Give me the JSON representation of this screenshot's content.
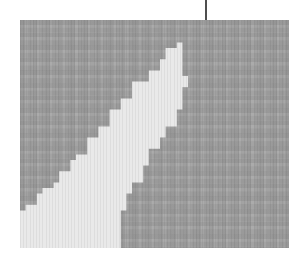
{
  "figure": {
    "kind": "grayscale-raster-map",
    "width": 299,
    "height": 262,
    "background_color": "#ffffff",
    "alt_caption": ""
  },
  "pointer": {
    "name": "leader-line",
    "color": "#4f4f4f",
    "x": 205,
    "y_top": 0,
    "y_bottom": 39,
    "thickness": 2
  },
  "map": {
    "x": 20,
    "y": 20,
    "width": 269,
    "height": 228,
    "cell_size": 12.6,
    "colors": {
      "region_dark": "#9a9a9a",
      "region_dark_cell": "#a6a6a6",
      "region_light": "#e9e9e9",
      "region_light_cell": "#f0f0f0",
      "edge_shadow": "#8d8d8d"
    },
    "regions": [
      {
        "name": "dark-region",
        "fill": "#9a9a9a",
        "description": "majority background region filling top, right and upper-left of the map"
      },
      {
        "name": "light-region",
        "fill": "#e9e9e9",
        "description": "light wedge occupying the lower-left, narrowing to an apex near the top-centre"
      }
    ]
  },
  "chart_data": {
    "type": "heatmap",
    "title": "",
    "subtitle": "",
    "xlabel": "",
    "ylabel": "",
    "grid": true,
    "legend": "none",
    "palette": [
      "#9a9a9a",
      "#e9e9e9"
    ],
    "levels": [
      0,
      1
    ],
    "boundary_note": "Two-level map: boundary runs from the lower-left edge up to an apex near the top-centre, then drops almost vertically to the bottom.",
    "boundary_left_polyline": [
      [
        20,
        248
      ],
      [
        20,
        216
      ],
      [
        28,
        210
      ],
      [
        36,
        203
      ],
      [
        44,
        196
      ],
      [
        52,
        188
      ],
      [
        60,
        180
      ],
      [
        68,
        172
      ],
      [
        78,
        162
      ],
      [
        88,
        152
      ],
      [
        98,
        140
      ],
      [
        110,
        126
      ],
      [
        122,
        112
      ],
      [
        134,
        98
      ],
      [
        146,
        84
      ],
      [
        158,
        70
      ],
      [
        168,
        58
      ],
      [
        176,
        48
      ],
      [
        182,
        42
      ]
    ],
    "boundary_right_polyline": [
      [
        182,
        42
      ],
      [
        184,
        52
      ],
      [
        185,
        64
      ],
      [
        186,
        76
      ],
      [
        184,
        88
      ],
      [
        180,
        100
      ],
      [
        174,
        112
      ],
      [
        166,
        124
      ],
      [
        158,
        136
      ],
      [
        150,
        150
      ],
      [
        142,
        166
      ],
      [
        134,
        182
      ],
      [
        128,
        196
      ],
      [
        122,
        212
      ],
      [
        118,
        228
      ],
      [
        116,
        248
      ]
    ],
    "pointer_annotation": {
      "x": 205,
      "y": 39,
      "label": ""
    }
  }
}
